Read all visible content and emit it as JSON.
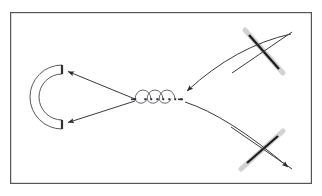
{
  "figure": {
    "title": "",
    "caption": "",
    "background_color": "#ffffff",
    "frame": {
      "label": "figure-border",
      "x": 10,
      "y": 12,
      "width": 302,
      "height": 172,
      "stroke_color": "#55555a",
      "stroke_width": 1.2,
      "fill": "#ffffff"
    }
  },
  "colors": {
    "line_dark": "#3a3a3f",
    "line_mid": "#58585e",
    "bar_gray": "#c9c9c9",
    "bar_gray_light": "#d8d8d8",
    "cross_dark": "#1d1d20",
    "frame": "#55555a",
    "white": "#ffffff"
  },
  "elements": {
    "reflector": {
      "name": "c-shaped-reflector",
      "description": "Open C-shaped arc with flat vertical end caps, opening to the right",
      "center_x": 62,
      "center_y": 97,
      "outer_radius": 32,
      "inner_radius": 23,
      "cap_top_x": 62,
      "cap_top_y": 68,
      "cap_bottom_x": 62,
      "cap_bottom_y": 126,
      "stroke_color": "#58585e",
      "stroke_width": 1.0
    },
    "coil": {
      "name": "coil-solenoid-symbol",
      "description": "Three-loop coil / solenoid drawn as semicircular arcs above a dotted baseline",
      "baseline_y": 99,
      "start_x": 135,
      "end_x": 180,
      "loop_count": 3,
      "loop_radius": 8,
      "dot_count": 6,
      "dot_size": 1.6,
      "stroke_color": "#58585e",
      "stroke_width": 0.9,
      "dot_color": "#2a2a2e"
    },
    "cross_top_right": {
      "name": "crossed-element-top-right",
      "description": "Light gray thick bar crossed by a thin dark diagonal line forming an X",
      "center_x": 262,
      "center_y": 50,
      "bar": {
        "x1": 245,
        "y1": 31,
        "x2": 282,
        "y2": 72,
        "width": 4.5,
        "color": "#c9c9c9"
      },
      "line": {
        "x1": 233,
        "y1": 72,
        "x2": 291,
        "y2": 33,
        "width": 1.0,
        "color": "#3a3a3f"
      },
      "dark_overlay": {
        "x1": 249,
        "y1": 36,
        "x2": 278,
        "y2": 68,
        "width": 2.2,
        "color": "#1d1d20"
      }
    },
    "cross_bottom_right": {
      "name": "crossed-element-bottom-right",
      "description": "Light gray thick bar crossed by a thin dark diagonal line forming an X",
      "center_x": 262,
      "center_y": 150,
      "bar": {
        "x1": 242,
        "y1": 167,
        "x2": 282,
        "y2": 132,
        "width": 4.5,
        "color": "#c9c9c9"
      },
      "line": {
        "x1": 232,
        "y1": 128,
        "x2": 292,
        "y2": 170,
        "width": 1.0,
        "color": "#3a3a3f"
      },
      "dark_overlay": {
        "x1": 248,
        "y1": 137,
        "x2": 278,
        "y2": 159,
        "width": 2.2,
        "color": "#1d1d20"
      }
    }
  },
  "arrows": [
    {
      "name": "arrow-coil-to-reflector-upper",
      "from": "coil",
      "to": "reflector-top-cap",
      "start_x": 135,
      "start_y": 99,
      "end_x": 66,
      "end_y": 71,
      "head": "end",
      "stroke_color": "#3a3a3f",
      "stroke_width": 1.0,
      "head_size": 5.5
    },
    {
      "name": "arrow-coil-to-reflector-lower",
      "from": "coil",
      "to": "reflector-bottom-cap",
      "start_x": 135,
      "start_y": 101,
      "end_x": 66,
      "end_y": 123,
      "head": "end",
      "stroke_color": "#3a3a3f",
      "stroke_width": 1.0,
      "head_size": 5.5
    },
    {
      "name": "arrow-top-right-cross-to-coil",
      "from": "crossed-element-top-right",
      "to": "coil",
      "start_x": 290,
      "start_y": 37,
      "control_x": 233,
      "control_y": 50,
      "end_x": 185,
      "end_y": 92,
      "head": "end",
      "curved": true,
      "stroke_color": "#3a3a3f",
      "stroke_width": 1.0,
      "head_size": 5.5
    },
    {
      "name": "arrow-coil-to-bottom-right-cross",
      "from": "coil",
      "to": "crossed-element-bottom-right",
      "start_x": 184,
      "start_y": 102,
      "control_x": 225,
      "control_y": 118,
      "end_x": 289,
      "end_y": 168,
      "head": "end",
      "curved": true,
      "stroke_color": "#3a3a3f",
      "stroke_width": 1.0,
      "head_size": 5.5
    }
  ],
  "labels": []
}
